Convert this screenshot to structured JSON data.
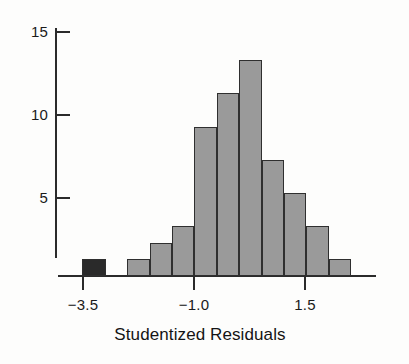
{
  "figure": {
    "background_color": "#fdfdfc",
    "axis_color": "#2b2b2b",
    "bar_fill_color": "#9a9a9a",
    "bar_highlight_color": "#2a2a2a",
    "bar_edge_color": "#2f2f2f"
  },
  "chart_data": {
    "type": "bar",
    "title": "",
    "subtitle": "",
    "xlabel": "Studentized Residuals",
    "ylabel": "",
    "x_tick_labels": [
      "−3.5",
      "−1.0",
      "1.5"
    ],
    "x_tick_values": [
      -3.5,
      -1.0,
      1.5
    ],
    "y_tick_labels": [
      "5",
      "10",
      "15"
    ],
    "y_tick_values": [
      5,
      10,
      15
    ],
    "xlim": [
      -3.75,
      2.0
    ],
    "ylim": [
      0,
      15.5
    ],
    "grid": false,
    "legend": null,
    "bin_width": 0.5,
    "bin_starts": [
      -3.5,
      -2.0,
      -1.5,
      -1.0,
      -0.5,
      0.0,
      0.5,
      1.0,
      1.5,
      2.0,
      2.5
    ],
    "categories": [
      "-3.5 to -3.0",
      "-2.0 to -1.5",
      "-1.5 to -1.0",
      "-1.0 to -0.5",
      "-0.5 to 0.0",
      "0.0 to 0.5",
      "0.5 to 1.0",
      "1.0 to 1.5",
      "1.5 to 2.0",
      "2.0 to 2.5",
      "2.5 to 3.0"
    ],
    "values": [
      1,
      1,
      2,
      3,
      9,
      11,
      13,
      7,
      5,
      3,
      1
    ],
    "highlighted_indices": [
      0
    ],
    "annotations": []
  },
  "bars": [
    {
      "label": "outlier bin at -3.5",
      "value": 1,
      "left": 82,
      "width": 24,
      "highlighted": true
    },
    {
      "label": "bin -2.0",
      "value": 1,
      "left": 127,
      "width": 23,
      "highlighted": false
    },
    {
      "label": "bin -1.5",
      "value": 2,
      "left": 150,
      "width": 22,
      "highlighted": false
    },
    {
      "label": "bin -1.25",
      "value": 3,
      "left": 172,
      "width": 22,
      "highlighted": false
    },
    {
      "label": "bin -1.0",
      "value": 9,
      "left": 194,
      "width": 23,
      "highlighted": false
    },
    {
      "label": "bin -0.5",
      "value": 11,
      "left": 217,
      "width": 22,
      "highlighted": false
    },
    {
      "label": "bin 0.0",
      "value": 13,
      "left": 239,
      "width": 23,
      "highlighted": false
    },
    {
      "label": "bin 0.5",
      "value": 7,
      "left": 262,
      "width": 22,
      "highlighted": false
    },
    {
      "label": "bin 1.0",
      "value": 5,
      "left": 284,
      "width": 22,
      "highlighted": false
    },
    {
      "label": "bin 1.5",
      "value": 3,
      "left": 306,
      "width": 23,
      "highlighted": false
    },
    {
      "label": "bin 2.0",
      "value": 1,
      "left": 329,
      "width": 22,
      "highlighted": false
    }
  ],
  "axes": {
    "y_ticks": [
      {
        "label": "15",
        "value": 15,
        "y": 31
      },
      {
        "label": "10",
        "value": 10,
        "y": 114
      },
      {
        "label": "5",
        "value": 5,
        "y": 197
      }
    ],
    "x_ticks": [
      {
        "label": "−3.5",
        "value": -3.5,
        "x": 82
      },
      {
        "label": "−1.0",
        "value": -1.0,
        "x": 193
      },
      {
        "label": "1.5",
        "value": 1.5,
        "x": 304
      }
    ],
    "x_axis_title": "Studentized Residuals",
    "baseline_y": 275,
    "y_axis_x": 55
  }
}
